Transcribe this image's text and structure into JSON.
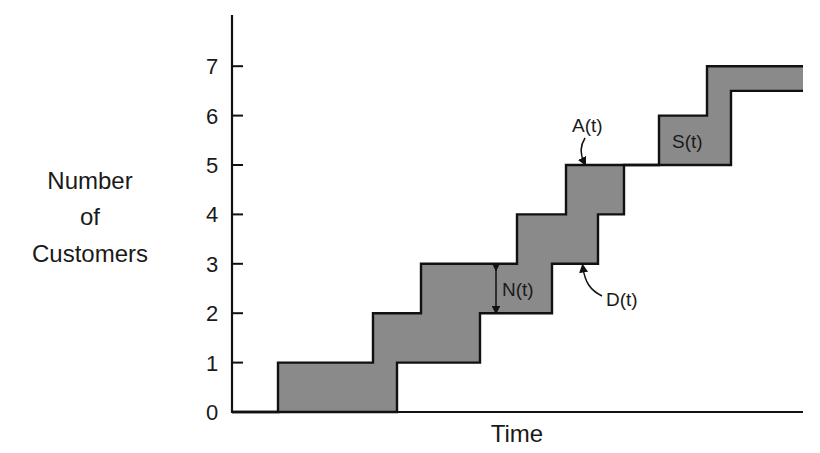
{
  "chart_data": {
    "type": "line",
    "subtype": "cumulative step functions (queueing diagram)",
    "title": "",
    "xlabel": "Time",
    "ylabel": "Number of Customers",
    "ylabel_lines": [
      "Number",
      "of",
      "Customers"
    ],
    "yticks": [
      0,
      1,
      2,
      3,
      4,
      5,
      6,
      7
    ],
    "ylim": [
      0,
      7.8
    ],
    "xticks": [],
    "grid": false,
    "legend": null,
    "series": [
      {
        "name": "A(t)",
        "description": "Cumulative arrivals (upper step curve)",
        "steps": [
          {
            "x": 278,
            "y": 1
          },
          {
            "x": 373,
            "y": 2
          },
          {
            "x": 421,
            "y": 3
          },
          {
            "x": 517,
            "y": 4
          },
          {
            "x": 566,
            "y": 5
          },
          {
            "x": 659,
            "y": 6
          },
          {
            "x": 707,
            "y": 7
          }
        ]
      },
      {
        "name": "D(t)",
        "description": "Cumulative departures (lower step curve)",
        "steps": [
          {
            "x": 397,
            "y": 1
          },
          {
            "x": 480,
            "y": 2
          },
          {
            "x": 552,
            "y": 3
          },
          {
            "x": 598,
            "y": 4
          },
          {
            "x": 624,
            "y": 5
          },
          {
            "x": 731,
            "y": 6.5
          }
        ]
      }
    ],
    "annotations": [
      {
        "text": "A(t)",
        "points_to": "arrival curve at level 5"
      },
      {
        "text": "D(t)",
        "points_to": "departure curve at level 3"
      },
      {
        "text": "N(t)",
        "meaning": "vertical distance between A(t) and D(t), shown with double arrow between levels 2 and 3"
      },
      {
        "text": "S(t)",
        "meaning": "shaded area between curves (level 5-6 region)"
      }
    ],
    "fill_color": "#8a8a8a",
    "line_color": "#111111"
  },
  "labels": {
    "a": "A(t)",
    "d": "D(t)",
    "n": "N(t)",
    "s": "S(t)",
    "time": "Time",
    "ylabel": [
      "Number",
      "of",
      "Customers"
    ],
    "ticks": [
      "0",
      "1",
      "2",
      "3",
      "4",
      "5",
      "6",
      "7"
    ]
  }
}
